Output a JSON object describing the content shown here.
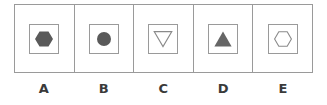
{
  "figure": {
    "name": "multiple-choice-shape-options",
    "colors": {
      "background": "#ffffff",
      "cell_border": "#9a9a9a",
      "frame_border": "#9a9a9a",
      "filled_shape": "#5a5a5a",
      "outline_shape": "#8a8a8a",
      "label_text": "#3a3a3a"
    },
    "options": [
      {
        "label": "A",
        "icon": "filled-hexagon-icon",
        "shape": "hexagon",
        "fill": "filled",
        "color": "#5a5a5a"
      },
      {
        "label": "B",
        "icon": "filled-circle-icon",
        "shape": "circle",
        "fill": "filled",
        "color": "#5a5a5a"
      },
      {
        "label": "C",
        "icon": "outline-triangle-down-icon",
        "shape": "triangle-down",
        "fill": "outline",
        "color": "#8a8a8a"
      },
      {
        "label": "D",
        "icon": "filled-triangle-up-icon",
        "shape": "triangle-up",
        "fill": "filled",
        "color": "#666666"
      },
      {
        "label": "E",
        "icon": "outline-hexagon-icon",
        "shape": "hexagon",
        "fill": "outline",
        "color": "#8a8a8a"
      }
    ]
  }
}
